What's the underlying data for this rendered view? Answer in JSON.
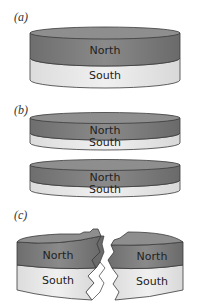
{
  "figure": {
    "panels": [
      {
        "id": "a",
        "label": "(a)",
        "layers": [
          "North",
          "South"
        ],
        "description": "single magnet disk"
      },
      {
        "id": "b",
        "label": "(b)",
        "disks": [
          {
            "layers": [
              "North",
              "South"
            ]
          },
          {
            "layers": [
              "North",
              "South"
            ]
          }
        ],
        "description": "disk split horizontally into two thinner disks, each with North and South"
      },
      {
        "id": "c",
        "label": "(c)",
        "pieces": [
          {
            "layers": [
              "North",
              "South"
            ]
          },
          {
            "layers": [
              "North",
              "South"
            ]
          }
        ],
        "description": "disk broken vertically into two pieces, each with North and South"
      }
    ]
  },
  "colors": {
    "north": "#7a7a7a",
    "north_top": "#8e8e8e",
    "south": "#e6e6e6",
    "outline": "#3a3a3a",
    "text": "#222222"
  }
}
